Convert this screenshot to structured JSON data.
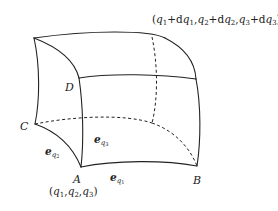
{
  "figure": {
    "type": "curvilinear-coordinate-volume-element",
    "top_label": {
      "open": "(",
      "q1": "q",
      "s1": "1",
      "plus1": "+d",
      "dq1": "q",
      "ds1": "1",
      "c1": ",",
      "q2": "q",
      "s2": "2",
      "plus2": "+d",
      "dq2": "q",
      "ds2": "2",
      "c2": ",",
      "q3": "q",
      "s3": "3",
      "plus3": "+d",
      "dq3": "q",
      "ds3": "3",
      "close": ")"
    },
    "points": {
      "A": "A",
      "B": "B",
      "C": "C",
      "D": "D"
    },
    "origin_label": {
      "open": "(",
      "q1": "q",
      "s1": "1",
      "c1": ",",
      "q2": "q",
      "s2": "2",
      "c2": ",",
      "q3": "q",
      "s3": "3",
      "close": ")"
    },
    "vectors": {
      "e1": {
        "base": "e",
        "sub": "q",
        "subsub": "1"
      },
      "e2": {
        "base": "e",
        "sub": "q",
        "subsub": "2"
      },
      "e3": {
        "base": "e",
        "sub": "q",
        "subsub": "3"
      }
    }
  },
  "colors": {
    "stroke": "#222222",
    "background": "#ffffff"
  }
}
